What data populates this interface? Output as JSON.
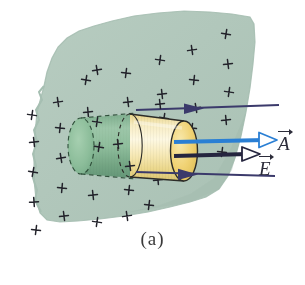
{
  "figure": {
    "caption": "(a)",
    "colors": {
      "plane_fill": "#b4c9bd",
      "plane_fill_dark": "#a7bfb2",
      "cylinder_front": "#f0de9a",
      "cylinder_front_light": "#fbf3cf",
      "cylinder_cap": "#efd068",
      "cylinder_behind": "#7fb08e",
      "cylinder_behind_dark": "#5f9a73",
      "arrow_field": "#3b3a6b",
      "arrow_area": "#2a7fd4",
      "charge_mark": "#1d1d23",
      "caption_text": "#3a3a3a"
    },
    "charge_marks": {
      "symbol": "+",
      "count": 33
    },
    "labels": [
      {
        "id": "label-A",
        "text": "A",
        "name": "area-vector-label",
        "color": "#2c2c3a"
      },
      {
        "id": "label-E",
        "text": "E",
        "name": "field-vector-label",
        "color": "#2c2c3a"
      }
    ],
    "arrows": [
      {
        "name": "field-arrow-top",
        "color": "#3b3a6b"
      },
      {
        "name": "area-vector-arrow",
        "color": "#2a7fd4"
      },
      {
        "name": "field-vector-arrow",
        "color": "#3b3a6b"
      },
      {
        "name": "field-arrow-bottom",
        "color": "#3b3a6b"
      }
    ]
  }
}
